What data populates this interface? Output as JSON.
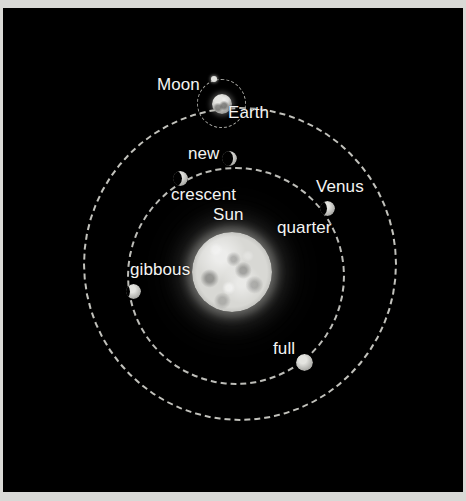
{
  "diagram": {
    "background_color": "#000000",
    "frame_color": "#d9d9d6",
    "orbit_line_color": "#bdbdb8",
    "label_color": "#f4f4f2",
    "bodies": {
      "sun": {
        "label": "Sun",
        "center_x": 232,
        "center_y": 272,
        "radius": 40,
        "color": "#d8d8d4"
      },
      "earth": {
        "label": "Earth",
        "center_x": 222,
        "center_y": 104,
        "radius": 10,
        "color": "#b8b8b4"
      },
      "moon": {
        "label": "Moon",
        "center_x": 214,
        "center_y": 79,
        "radius": 3,
        "color": "#e2e2de"
      },
      "venus": {
        "label": "Venus",
        "center_x": 327,
        "center_y": 208,
        "radius": 8,
        "color": "#b6b6b2"
      }
    },
    "orbits": [
      {
        "name": "earth-orbit",
        "center_x": 240,
        "center_y": 264,
        "radius": 157,
        "style": "dashed"
      },
      {
        "name": "venus-orbit",
        "center_x": 236,
        "center_y": 276,
        "radius": 109,
        "style": "dashed"
      },
      {
        "name": "moon-orbit",
        "center_x": 221,
        "center_y": 103,
        "radius": 24,
        "style": "dashed"
      }
    ],
    "phase_labels": [
      {
        "key": "new",
        "label": "new",
        "x": 188,
        "y": 145
      },
      {
        "key": "crescent",
        "label": "crescent",
        "x": 171,
        "y": 186
      },
      {
        "key": "quarter",
        "label": "quarter",
        "x": 277,
        "y": 219
      },
      {
        "key": "gibbous",
        "label": "gibbous",
        "x": 130,
        "y": 261
      },
      {
        "key": "full",
        "label": "full",
        "x": 273,
        "y": 340
      }
    ]
  },
  "labels": {
    "moon": "Moon",
    "earth": "Earth",
    "new": "new",
    "crescent": "crescent",
    "venus": "Venus",
    "sun": "Sun",
    "quarter": "quarter",
    "gibbous": "gibbous",
    "full": "full"
  }
}
